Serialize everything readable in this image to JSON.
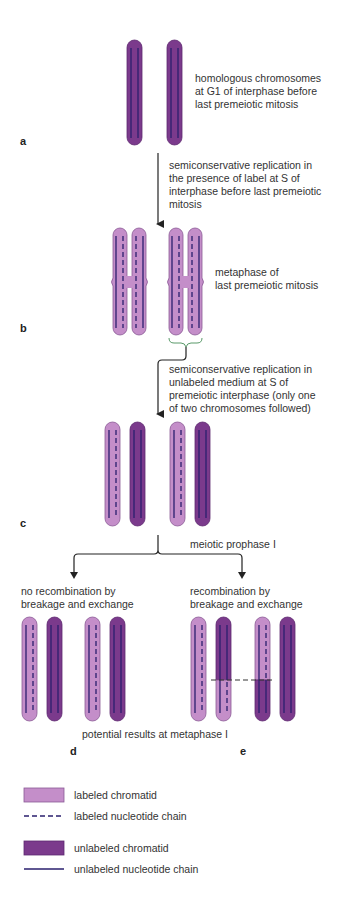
{
  "colors": {
    "labeled_chromatid": "#c48ec9",
    "unlabeled_chromatid": "#7b3a8c",
    "chain": "#2a1f6e",
    "arrow": "#222222",
    "bracket": "#5a9a6a"
  },
  "panels": {
    "a": {
      "label": "a",
      "caption": "homologous chromosomes\nat G1 of interphase before\nlast premeiotic mitosis"
    },
    "step_ab": {
      "caption": "semiconservative replication in\nthe presence of label at S of\ninterphase before last premeiotic\nmitosis"
    },
    "b": {
      "label": "b",
      "caption": "metaphase of\nlast premeiotic mitosis"
    },
    "step_bc": {
      "caption": "semiconservative replication in\nunlabeled medium at S of\npremeiotic interphase (only one\nof two chromosomes followed)"
    },
    "c": {
      "label": "c",
      "caption": "meiotic prophase I"
    },
    "d": {
      "label": "d",
      "caption": "no recombination by\nbreakage and exchange"
    },
    "e": {
      "label": "e",
      "caption": "recombination by\nbreakage and exchange"
    },
    "bottom_caption": "potential results at metaphase I"
  },
  "legend": {
    "items": [
      {
        "icon": "labeled-chromatid-swatch",
        "label": "labeled chromatid"
      },
      {
        "icon": "dashed-line",
        "label": "labeled nucleotide chain"
      },
      {
        "icon": "unlabeled-chromatid-swatch",
        "label": "unlabeled chromatid"
      },
      {
        "icon": "solid-line",
        "label": "unlabeled nucleotide chain"
      }
    ]
  }
}
